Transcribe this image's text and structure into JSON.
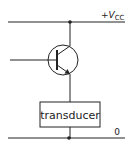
{
  "diagram": {
    "type": "circuit-schematic",
    "supply_label": {
      "prefix": "+",
      "symbol": "V",
      "subscript": "CC"
    },
    "ground_label": "0",
    "transducer_label": "transducer",
    "components": [
      {
        "id": "transistor",
        "kind": "npn-bjt"
      },
      {
        "id": "transducer",
        "kind": "block",
        "label": "transducer"
      }
    ],
    "colors": {
      "line": "#222222",
      "background": "#ffffff"
    }
  }
}
